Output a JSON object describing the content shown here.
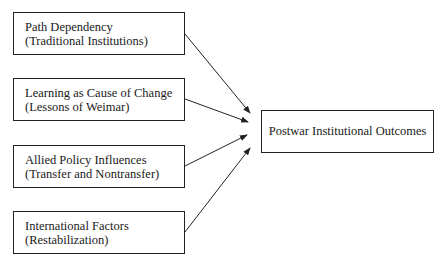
{
  "diagram": {
    "sources": [
      {
        "title": "Path Dependency",
        "subtitle": "(Traditional Institutions)"
      },
      {
        "title": "Learning as Cause of Change",
        "subtitle": "(Lessons of Weimar)"
      },
      {
        "title": "Allied Policy Influences",
        "subtitle": "(Transfer and Nontransfer)"
      },
      {
        "title": "International Factors",
        "subtitle": "(Restabilization)"
      }
    ],
    "target": {
      "label": "Postwar Institutional Outcomes"
    },
    "edges": [
      {
        "from": 0,
        "to": "target"
      },
      {
        "from": 1,
        "to": "target"
      },
      {
        "from": 2,
        "to": "target"
      },
      {
        "from": 3,
        "to": "target"
      }
    ],
    "colors": {
      "stroke": "#222222",
      "background": "#ffffff"
    }
  }
}
